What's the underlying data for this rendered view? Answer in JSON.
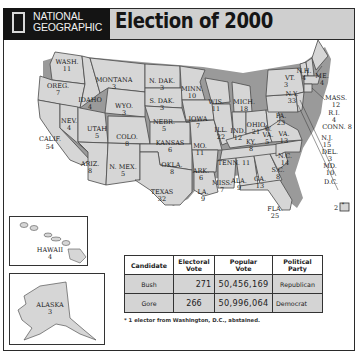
{
  "header": {
    "brand_line1": "NATIONAL",
    "brand_line2": "GEOGRAPHIC",
    "title": "Election of 2000"
  },
  "map": {
    "states": [
      {
        "name": "WASH.",
        "votes": "11"
      },
      {
        "name": "OREG.",
        "votes": "7"
      },
      {
        "name": "CALIF.",
        "votes": "54"
      },
      {
        "name": "IDAHO",
        "votes": "4"
      },
      {
        "name": "NEV.",
        "votes": "4"
      },
      {
        "name": "MONTANA",
        "votes": "3"
      },
      {
        "name": "WYO.",
        "votes": "3"
      },
      {
        "name": "UTAH",
        "votes": "5"
      },
      {
        "name": "ARIZ.",
        "votes": "8"
      },
      {
        "name": "COLO.",
        "votes": "8"
      },
      {
        "name": "N. MEX.",
        "votes": "5"
      },
      {
        "name": "N. DAK.",
        "votes": "3"
      },
      {
        "name": "S. DAK.",
        "votes": "3"
      },
      {
        "name": "NEBR.",
        "votes": "5"
      },
      {
        "name": "KANSAS",
        "votes": "6"
      },
      {
        "name": "OKLA.",
        "votes": "8"
      },
      {
        "name": "TEXAS",
        "votes": "32"
      },
      {
        "name": "MINN.",
        "votes": "10"
      },
      {
        "name": "IOWA",
        "votes": "7"
      },
      {
        "name": "MO.",
        "votes": "11"
      },
      {
        "name": "ARK.",
        "votes": "6"
      },
      {
        "name": "LA.",
        "votes": "9"
      },
      {
        "name": "WIS.",
        "votes": "11"
      },
      {
        "name": "ILL.",
        "votes": "22"
      },
      {
        "name": "MICH.",
        "votes": "18"
      },
      {
        "name": "IND.",
        "votes": "12"
      },
      {
        "name": "OHIO",
        "votes": "21"
      },
      {
        "name": "KY.",
        "votes": "8"
      },
      {
        "name": "TENN.",
        "votes": "11"
      },
      {
        "name": "MISS.",
        "votes": "7"
      },
      {
        "name": "ALA.",
        "votes": "9"
      },
      {
        "name": "GA.",
        "votes": "13"
      },
      {
        "name": "FLA.",
        "votes": "25"
      },
      {
        "name": "S.C.",
        "votes": "8"
      },
      {
        "name": "N.C.",
        "votes": "14"
      },
      {
        "name": "VA.",
        "votes": "13"
      },
      {
        "name": "W. VA.",
        "votes": "5"
      },
      {
        "name": "PA.",
        "votes": "23"
      },
      {
        "name": "N.Y.",
        "votes": "33"
      },
      {
        "name": "VT.",
        "votes": "3"
      },
      {
        "name": "N.H.",
        "votes": "4"
      },
      {
        "name": "ME.",
        "votes": "4"
      },
      {
        "name": "MASS.",
        "votes": "12"
      },
      {
        "name": "R.I.",
        "votes": "4"
      },
      {
        "name": "CONN.",
        "votes": "8"
      },
      {
        "name": "N.J.",
        "votes": "15"
      },
      {
        "name": "DEL.",
        "votes": "3"
      },
      {
        "name": "MD.",
        "votes": "10"
      },
      {
        "name": "D.C.",
        "votes": "2*"
      },
      {
        "name": "HAWAII",
        "votes": "4"
      },
      {
        "name": "ALASKA",
        "votes": "3"
      }
    ]
  },
  "table": {
    "headers": [
      "Candidate",
      "Electoral Vote",
      "Popular Vote",
      "Political Party"
    ],
    "header_lines": [
      [
        "Candidate"
      ],
      [
        "Electoral",
        "Vote"
      ],
      [
        "Popular",
        "Vote"
      ],
      [
        "Political",
        "Party"
      ]
    ],
    "rows": [
      {
        "candidate": "Bush",
        "electoral": "271",
        "popular": "50,456,169",
        "party": "Republican"
      },
      {
        "candidate": "Gore",
        "electoral": "266",
        "popular": "50,996,064",
        "party": "Democrat"
      }
    ]
  },
  "footnote": "* 1 elector from Washington, D.C., abstained.",
  "colors": {
    "state_fill": "#d6d6d6",
    "state_border": "#4a4a4a",
    "shadow": "#9a9a9a",
    "header_bg": "#cfcfcf",
    "brand_bg": "#141414"
  }
}
